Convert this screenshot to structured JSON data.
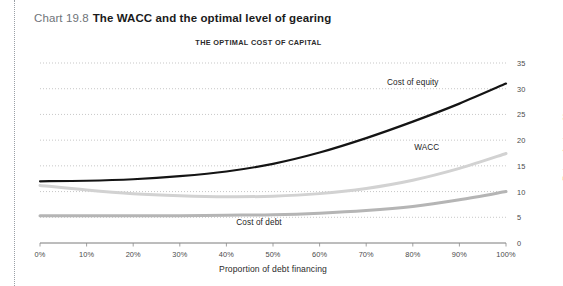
{
  "figure": {
    "number": "Chart 19.8",
    "title": "The WACC and the optimal level of gearing"
  },
  "chart_data": {
    "type": "line",
    "title": "THE OPTIMAL COST OF CAPITAL",
    "xlabel": "Proportion of debt financing",
    "ylabel": "Rates of return, %",
    "xlim": [
      0,
      100
    ],
    "ylim": [
      0,
      35
    ],
    "grid": true,
    "legend": "inline-annotations",
    "xticks": [
      "0%",
      "10%",
      "20%",
      "30%",
      "40%",
      "50%",
      "60%",
      "70%",
      "80%",
      "90%",
      "100%"
    ],
    "xtick_values": [
      0,
      10,
      20,
      30,
      40,
      50,
      60,
      70,
      80,
      90,
      100
    ],
    "yticks": [
      "0",
      "5",
      "10",
      "15",
      "20",
      "25",
      "30",
      "35"
    ],
    "ytick_values": [
      0,
      5,
      10,
      15,
      20,
      25,
      30,
      35
    ],
    "x": [
      0,
      10,
      20,
      30,
      40,
      50,
      60,
      70,
      80,
      90,
      100
    ],
    "series": [
      {
        "name": "Cost of equity",
        "color": "#141414",
        "width": 2.2,
        "label_x": 80,
        "label_y": 31.4,
        "values": [
          12.0,
          12.1,
          12.4,
          13.0,
          13.9,
          15.4,
          17.6,
          20.4,
          23.6,
          27.1,
          31.0
        ]
      },
      {
        "name": "WACC",
        "color": "#d2d2d2",
        "width": 3.0,
        "label_x": 83,
        "label_y": 18.6,
        "values": [
          11.2,
          10.3,
          9.6,
          9.2,
          9.0,
          9.1,
          9.6,
          10.6,
          12.2,
          14.5,
          17.4
        ]
      },
      {
        "name": "Cost of debt",
        "color": "#b5b5b5",
        "width": 3.0,
        "label_x": 47,
        "label_y": 4.0,
        "values": [
          5.3,
          5.3,
          5.3,
          5.3,
          5.4,
          5.5,
          5.8,
          6.3,
          7.1,
          8.4,
          10.0
        ]
      }
    ]
  }
}
